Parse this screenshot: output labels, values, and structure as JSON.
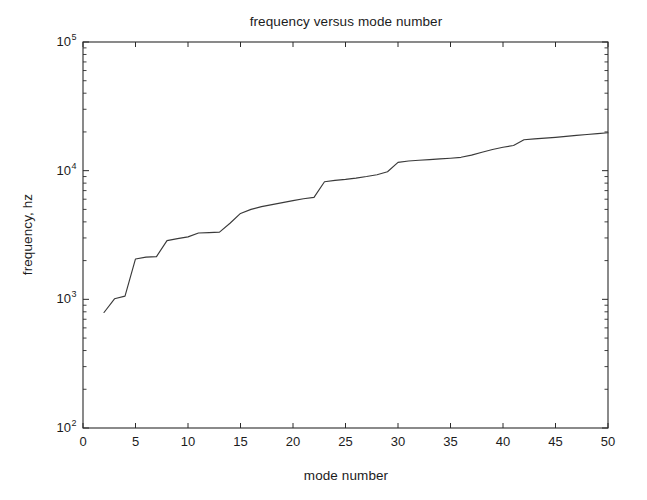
{
  "figure": {
    "width": 647,
    "height": 500,
    "background": "#ffffff",
    "line_color": "#3a3a3a",
    "axis_color": "#2b2b2b"
  },
  "chart_data": {
    "type": "line",
    "title": "frequency versus mode number",
    "xlabel": "mode number",
    "ylabel": "frequency, hz",
    "xscale": "linear",
    "yscale": "log",
    "xlim": [
      0,
      50
    ],
    "ylim": [
      100,
      100000
    ],
    "grid": false,
    "legend": null,
    "xticks": [
      0,
      5,
      10,
      15,
      20,
      25,
      30,
      35,
      40,
      45,
      50
    ],
    "xtick_labels": [
      "0",
      "5",
      "10",
      "15",
      "20",
      "25",
      "30",
      "35",
      "40",
      "45",
      "50"
    ],
    "yticks": [
      100,
      1000,
      10000,
      100000
    ],
    "ytick_labels": [
      "10^2",
      "10^3",
      "10^4",
      "10^5"
    ],
    "ytick_mantissa": "10",
    "ytick_exponents": [
      "2",
      "3",
      "4",
      "5"
    ],
    "y_minor_ticks": true,
    "series": [
      {
        "name": "frequency",
        "x": [
          2,
          3,
          4,
          5,
          6,
          7,
          8,
          9,
          10,
          11,
          12,
          13,
          14,
          15,
          16,
          17,
          18,
          19,
          20,
          21,
          22,
          23,
          24,
          25,
          26,
          27,
          28,
          29,
          30,
          31,
          32,
          33,
          34,
          35,
          36,
          37,
          38,
          39,
          40,
          41,
          42,
          43,
          44,
          45,
          46,
          47,
          48,
          49,
          50
        ],
        "y": [
          790,
          1010,
          1060,
          2060,
          2130,
          2150,
          2860,
          2960,
          3060,
          3280,
          3300,
          3330,
          3900,
          4650,
          5000,
          5250,
          5450,
          5650,
          5850,
          6050,
          6200,
          8200,
          8400,
          8550,
          8750,
          9000,
          9300,
          9800,
          11600,
          11900,
          12050,
          12200,
          12350,
          12500,
          12700,
          13200,
          13900,
          14600,
          15200,
          15700,
          17400,
          17650,
          17900,
          18150,
          18450,
          18800,
          19100,
          19400,
          19700
        ]
      }
    ],
    "annotations": []
  },
  "axes": {
    "plot_box": {
      "left": 83,
      "top": 42,
      "right": 608,
      "bottom": 428
    },
    "tick_direction": "in",
    "box_on": true
  }
}
